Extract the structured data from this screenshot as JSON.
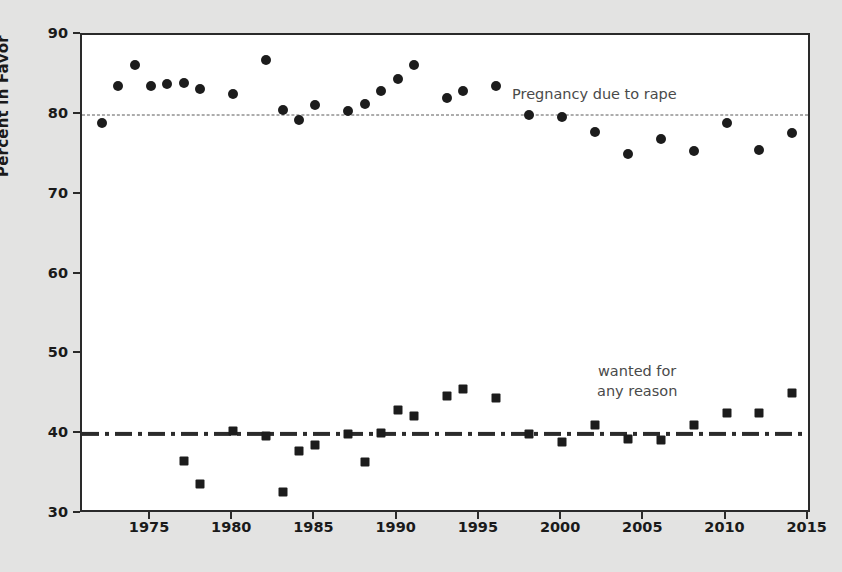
{
  "chart_data": {
    "type": "scatter",
    "title": "",
    "xlabel": "",
    "ylabel": "Percent in Favor",
    "xlim": [
      1970.8,
      2015.2
    ],
    "ylim": [
      30,
      90
    ],
    "grid": false,
    "legend_position": "inline-annotations",
    "x_ticks": [
      1975,
      1980,
      1985,
      1990,
      1995,
      2000,
      2005,
      2010,
      2015
    ],
    "y_ticks": [
      30,
      40,
      50,
      60,
      70,
      80,
      90
    ],
    "annotations": [
      {
        "text": "Pregnancy due to rape",
        "x": 1992.5,
        "y": 82.5,
        "marker": "circle"
      },
      {
        "text": "wanted for\nany reason",
        "x": 2003.0,
        "y": 47.0,
        "marker": "square"
      }
    ],
    "reference_lines": [
      {
        "y": 80,
        "style": "dashed",
        "color": "#5a5a5a",
        "series": "Pregnancy due to rape"
      },
      {
        "y": 40,
        "style": "dash-dot",
        "color": "#2b2b2b",
        "series": "wanted for any reason"
      }
    ],
    "series": [
      {
        "name": "Pregnancy due to rape",
        "marker": "circle",
        "color": "#1c1c1c",
        "points": [
          {
            "x": 1972,
            "y": 79.0
          },
          {
            "x": 1973,
            "y": 83.6
          },
          {
            "x": 1974,
            "y": 86.3
          },
          {
            "x": 1975,
            "y": 83.6
          },
          {
            "x": 1976,
            "y": 83.9
          },
          {
            "x": 1977,
            "y": 84.0
          },
          {
            "x": 1978,
            "y": 83.2
          },
          {
            "x": 1980,
            "y": 82.6
          },
          {
            "x": 1982,
            "y": 86.9
          },
          {
            "x": 1983,
            "y": 80.6
          },
          {
            "x": 1984,
            "y": 79.4
          },
          {
            "x": 1985,
            "y": 81.2
          },
          {
            "x": 1987,
            "y": 80.5
          },
          {
            "x": 1988,
            "y": 81.3
          },
          {
            "x": 1989,
            "y": 83.0
          },
          {
            "x": 1990,
            "y": 84.5
          },
          {
            "x": 1991,
            "y": 86.2
          },
          {
            "x": 1993,
            "y": 82.1
          },
          {
            "x": 1994,
            "y": 83.0
          },
          {
            "x": 1996,
            "y": 83.6
          },
          {
            "x": 1998,
            "y": 80.0
          },
          {
            "x": 2000,
            "y": 79.7
          },
          {
            "x": 2002,
            "y": 77.8
          },
          {
            "x": 2004,
            "y": 75.1
          },
          {
            "x": 2006,
            "y": 77.0
          },
          {
            "x": 2008,
            "y": 75.5
          },
          {
            "x": 2010,
            "y": 79.0
          },
          {
            "x": 2012,
            "y": 75.6
          },
          {
            "x": 2014,
            "y": 77.7
          }
        ]
      },
      {
        "name": "wanted for any reason",
        "marker": "square",
        "color": "#1c1c1c",
        "points": [
          {
            "x": 1977,
            "y": 36.6
          },
          {
            "x": 1978,
            "y": 33.7
          },
          {
            "x": 1980,
            "y": 40.4
          },
          {
            "x": 1982,
            "y": 39.8
          },
          {
            "x": 1983,
            "y": 32.7
          },
          {
            "x": 1984,
            "y": 37.9
          },
          {
            "x": 1985,
            "y": 38.6
          },
          {
            "x": 1987,
            "y": 40.0
          },
          {
            "x": 1988,
            "y": 36.5
          },
          {
            "x": 1989,
            "y": 40.2
          },
          {
            "x": 1990,
            "y": 43.0
          },
          {
            "x": 1991,
            "y": 42.3
          },
          {
            "x": 1993,
            "y": 44.8
          },
          {
            "x": 1994,
            "y": 45.7
          },
          {
            "x": 1996,
            "y": 44.5
          },
          {
            "x": 1998,
            "y": 40.0
          },
          {
            "x": 2000,
            "y": 39.0
          },
          {
            "x": 2002,
            "y": 41.1
          },
          {
            "x": 2004,
            "y": 39.4
          },
          {
            "x": 2006,
            "y": 39.3
          },
          {
            "x": 2008,
            "y": 41.1
          },
          {
            "x": 2010,
            "y": 42.7
          },
          {
            "x": 2012,
            "y": 42.6
          },
          {
            "x": 2014,
            "y": 45.1
          }
        ]
      }
    ]
  },
  "colors": {
    "background": "#e3e3e2",
    "plot_background": "#ffffff",
    "axis": "#2a2a2a",
    "marker": "#1c1c1c",
    "annotation_text": "#4a4a4a",
    "ref_line_upper": "#5a5a5a",
    "ref_line_lower": "#2b2b2b"
  }
}
